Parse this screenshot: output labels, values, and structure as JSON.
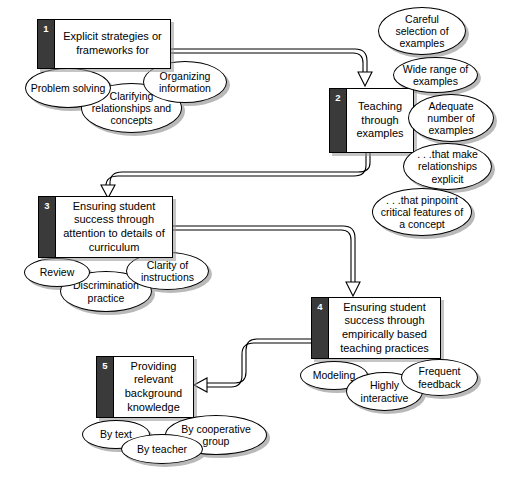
{
  "diagram": {
    "accent_dark": "#3a3a3a",
    "line_color": "#000000",
    "background": "#ffffff",
    "nodes": [
      {
        "number": "1",
        "label": "Explicit strategies or frameworks for",
        "satellites": [
          "Problem solving",
          "Clarifying relationships and concepts",
          "Organizing information"
        ]
      },
      {
        "number": "2",
        "label": "Teaching through examples",
        "satellites": [
          "Careful selection of examples",
          "Wide range of examples",
          "Adequate number of examples",
          ". . .that make relationships explicit",
          ". . .that pinpoint critical features of a concept"
        ]
      },
      {
        "number": "3",
        "label": "Ensuring student success through attention to details of curriculum",
        "satellites": [
          "Review",
          "Discrimination practice",
          "Clarity of instructions"
        ]
      },
      {
        "number": "4",
        "label": "Ensuring student success through empirically based teaching practices",
        "satellites": [
          "Modeling",
          "Highly interactive",
          "Frequent feedback"
        ]
      },
      {
        "number": "5",
        "label": "Providing relevant background knowledge",
        "satellites": [
          "By text",
          "By teacher",
          "By cooperative group"
        ]
      }
    ],
    "connectors": [
      {
        "from": "1",
        "to": "2",
        "style": "double-line-hollow-arrow"
      },
      {
        "from": "2",
        "to": "3",
        "style": "double-line-hollow-arrow"
      },
      {
        "from": "3",
        "to": "4",
        "style": "double-line-hollow-arrow"
      },
      {
        "from": "4",
        "to": "5",
        "style": "double-line-hollow-arrow"
      }
    ]
  }
}
